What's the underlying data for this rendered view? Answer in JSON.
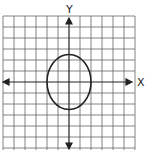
{
  "diagram": {
    "type": "coordinate-plane-ellipse",
    "axes": {
      "x_label": "X",
      "y_label": "Y"
    },
    "grid": {
      "columns": 12,
      "rows": 12,
      "cell_px": 11.1
    },
    "ellipse": {
      "center": [
        0,
        0
      ],
      "semi_axis_x": 2,
      "semi_axis_y": 2.5
    },
    "colors": {
      "grid": "#555555",
      "axis": "#222222",
      "curve": "#222222"
    }
  }
}
